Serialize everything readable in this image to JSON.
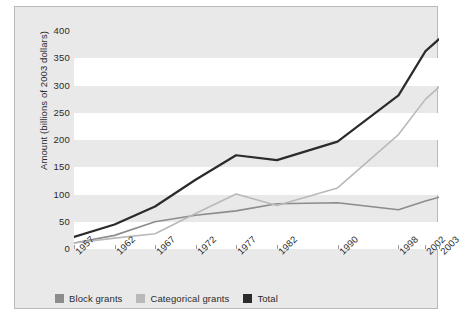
{
  "chart_data": {
    "type": "line",
    "title": "",
    "xlabel": "",
    "ylabel": "Amount (billions of 2003 dollars)",
    "categories": [
      "1957",
      "1962",
      "1967",
      "1972",
      "1977",
      "1982",
      "1990",
      "1998",
      "2002",
      "2003"
    ],
    "x_positions": [
      0.0,
      0.111,
      0.222,
      0.333,
      0.444,
      0.556,
      0.722,
      0.889,
      0.963,
      1.0
    ],
    "series": [
      {
        "name": "Block grants",
        "color": "#8c8c8c",
        "values": [
          11,
          25,
          50,
          62,
          70,
          83,
          85,
          72,
          88,
          95
        ]
      },
      {
        "name": "Categorical grants",
        "color": "#b9b9b9",
        "values": [
          11,
          20,
          28,
          65,
          101,
          80,
          112,
          210,
          275,
          297
        ]
      },
      {
        "name": "Total",
        "color": "#2b2b2b",
        "values": [
          22,
          45,
          78,
          127,
          172,
          163,
          197,
          282,
          363,
          385
        ]
      }
    ],
    "yticks": [
      0,
      50,
      100,
      150,
      200,
      250,
      300,
      350,
      400
    ],
    "ylim": [
      0,
      400
    ],
    "grid": "horizontal-alternating-bands",
    "legend_position": "bottom-left"
  },
  "legend": {
    "items": [
      {
        "label": "Block grants",
        "color": "#8c8c8c"
      },
      {
        "label": "Categorical grants",
        "color": "#b9b9b9"
      },
      {
        "label": "Total",
        "color": "#2b2b2b"
      }
    ]
  },
  "colors": {
    "panel_background": "#e9e9e9",
    "band_background": "#ffffff",
    "panel_border": "#b9b9b9",
    "text": "#2b2b2b"
  }
}
